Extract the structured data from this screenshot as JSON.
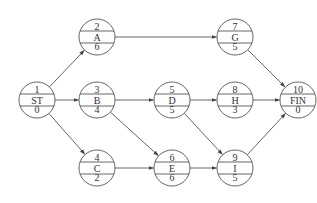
{
  "diagram": {
    "type": "activity-on-node network",
    "nodes": [
      {
        "id": "ST",
        "top": "1",
        "mid": "ST",
        "bottom": "0",
        "x": 37,
        "y": 100
      },
      {
        "id": "A",
        "top": "2",
        "mid": "A",
        "bottom": "6",
        "x": 97,
        "y": 37
      },
      {
        "id": "B",
        "top": "3",
        "mid": "B",
        "bottom": "4",
        "x": 97,
        "y": 100
      },
      {
        "id": "C",
        "top": "4",
        "mid": "C",
        "bottom": "2",
        "x": 97,
        "y": 168
      },
      {
        "id": "D",
        "top": "5",
        "mid": "D",
        "bottom": "5",
        "x": 172,
        "y": 100
      },
      {
        "id": "E",
        "top": "6",
        "mid": "E",
        "bottom": "6",
        "x": 172,
        "y": 168
      },
      {
        "id": "G",
        "top": "7",
        "mid": "G",
        "bottom": "5",
        "x": 235,
        "y": 37
      },
      {
        "id": "H",
        "top": "8",
        "mid": "H",
        "bottom": "3",
        "x": 235,
        "y": 100
      },
      {
        "id": "I",
        "top": "9",
        "mid": "I",
        "bottom": "5",
        "x": 235,
        "y": 168
      },
      {
        "id": "FIN",
        "top": "10",
        "mid": "FIN",
        "bottom": "0",
        "x": 298,
        "y": 100
      }
    ],
    "edges": [
      [
        "ST",
        "A"
      ],
      [
        "ST",
        "B"
      ],
      [
        "ST",
        "C"
      ],
      [
        "A",
        "G"
      ],
      [
        "B",
        "D"
      ],
      [
        "B",
        "E"
      ],
      [
        "C",
        "E"
      ],
      [
        "D",
        "H"
      ],
      [
        "D",
        "I"
      ],
      [
        "E",
        "I"
      ],
      [
        "G",
        "FIN"
      ],
      [
        "H",
        "FIN"
      ],
      [
        "I",
        "FIN"
      ]
    ],
    "colors": {
      "stroke": "#555555",
      "text": "#333333",
      "background": "#ffffff"
    }
  }
}
